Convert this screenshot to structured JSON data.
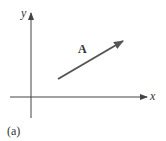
{
  "diagram": {
    "x_axis_label": "x",
    "y_axis_label": "y",
    "vector_label": "A",
    "caption": "(a)",
    "vector_color": "#555555",
    "axis_color": "#444444"
  }
}
